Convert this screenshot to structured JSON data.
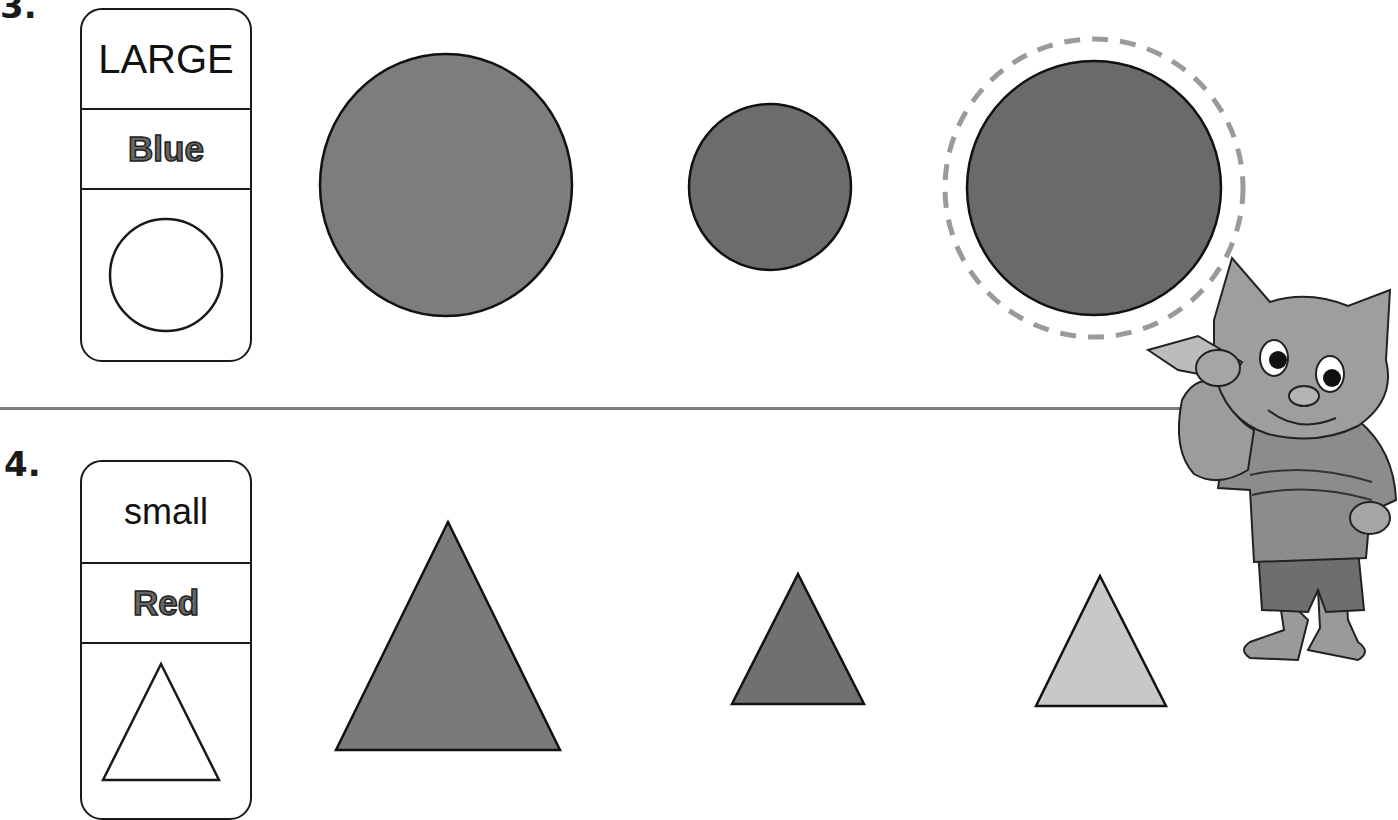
{
  "worksheet": {
    "problems": [
      {
        "number": "3.",
        "clue_card": {
          "size": "LARGE",
          "color": "Blue",
          "shape": "circle-outline-icon"
        },
        "answer_choices": [
          {
            "shape": "circle",
            "size": "large",
            "fill": "#7d7d7d",
            "selected": false
          },
          {
            "shape": "circle",
            "size": "small",
            "fill": "#6c6c6c",
            "selected": false
          },
          {
            "shape": "circle",
            "size": "large",
            "fill": "#6a6a6a",
            "selected": true
          }
        ]
      },
      {
        "number": "4.",
        "clue_card": {
          "size": "small",
          "color": "Red",
          "shape": "triangle-outline-icon"
        },
        "answer_choices": [
          {
            "shape": "triangle",
            "size": "large",
            "fill": "#7a7a7a",
            "selected": false
          },
          {
            "shape": "triangle",
            "size": "small",
            "fill": "#707070",
            "selected": false
          },
          {
            "shape": "triangle",
            "size": "small",
            "fill": "#c8c8c8",
            "selected": false
          }
        ]
      }
    ],
    "selection_marker": {
      "style": "dashed-circle",
      "color": "#9a9a9a"
    },
    "mascot": "cartoon-cat-with-pencil"
  }
}
